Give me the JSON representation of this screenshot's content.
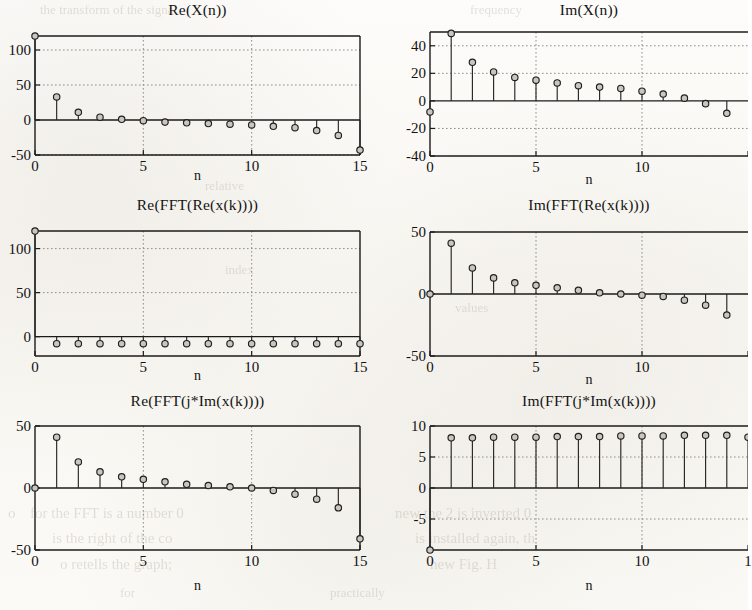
{
  "figure": {
    "background_color": "#fbfaf7",
    "ink_color": "#1b1b1b",
    "marker_fill": "#c9c6bf",
    "grid_color": "#8e8e8e"
  },
  "bleed_through_text": [
    {
      "text": "the transform of the signal",
      "x": 40,
      "y": 2,
      "size": 13
    },
    {
      "text": "frequency",
      "x": 470,
      "y": 2,
      "size": 13
    },
    {
      "text": "relative",
      "x": 205,
      "y": 178,
      "size": 13
    },
    {
      "text": "index",
      "x": 225,
      "y": 262,
      "size": 13
    },
    {
      "text": "values",
      "x": 455,
      "y": 300,
      "size": 13
    },
    {
      "text": "for the FFT is a number 0",
      "x": 30,
      "y": 505,
      "size": 15
    },
    {
      "text": "o",
      "x": 8,
      "y": 505,
      "size": 15
    },
    {
      "text": "is the right of the co",
      "x": 52,
      "y": 530,
      "size": 15
    },
    {
      "text": "o retells the graph;",
      "x": 60,
      "y": 556,
      "size": 15
    },
    {
      "text": "new the  2  is  inverted 0",
      "x": 395,
      "y": 505,
      "size": 15
    },
    {
      "text": "is installed again, th",
      "x": 415,
      "y": 530,
      "size": 15
    },
    {
      "text": "new Fig. H",
      "x": 430,
      "y": 556,
      "size": 15
    },
    {
      "text": "for",
      "x": 120,
      "y": 585,
      "size": 13
    },
    {
      "text": "practically",
      "x": 330,
      "y": 585,
      "size": 13
    }
  ],
  "chart_data": [
    {
      "id": "re-xn",
      "type": "stem",
      "title": "Re(X(n))",
      "xlabel": "n",
      "ylabel": "",
      "x": [
        0,
        1,
        2,
        3,
        4,
        5,
        6,
        7,
        8,
        9,
        10,
        11,
        12,
        13,
        14,
        15
      ],
      "values": [
        120,
        33,
        11,
        4,
        1,
        -1,
        -3,
        -4,
        -5,
        -6,
        -7,
        -9,
        -11,
        -15,
        -22,
        -43
      ],
      "xlim": [
        0,
        15
      ],
      "ylim": [
        -50,
        120
      ],
      "xticks": [
        0,
        5,
        10,
        15
      ],
      "xticklabels": [
        "0",
        "5",
        "10",
        "15"
      ],
      "yticks": [
        -50,
        0,
        50,
        100
      ],
      "yticklabels": [
        "-50",
        "0",
        "50",
        "100"
      ],
      "gridlines_y": [
        -50,
        50,
        100
      ],
      "gridlines_x": [
        5,
        10
      ],
      "grid": true,
      "baseline": 0,
      "clipped_right": false
    },
    {
      "id": "im-xn",
      "type": "stem",
      "title": "Im(X(n))",
      "xlabel": "n",
      "ylabel": "",
      "x": [
        0,
        1,
        2,
        3,
        4,
        5,
        6,
        7,
        8,
        9,
        10,
        11,
        12,
        13,
        14
      ],
      "values": [
        -8,
        49,
        28,
        21,
        17,
        15,
        13,
        11,
        10,
        9,
        7,
        5,
        2,
        -2,
        -9
      ],
      "xlim": [
        0,
        15
      ],
      "ylim": [
        -40,
        50
      ],
      "xticks": [
        0,
        5,
        10,
        15
      ],
      "xticklabels": [
        "0",
        "5",
        "10",
        ""
      ],
      "yticks": [
        -40,
        -20,
        0,
        20,
        40
      ],
      "yticklabels": [
        "-40",
        "-20",
        "0",
        "20",
        "40"
      ],
      "gridlines_y": [
        -20,
        20,
        40
      ],
      "gridlines_x": [
        5,
        10
      ],
      "grid": true,
      "baseline": 0,
      "clipped_right": true
    },
    {
      "id": "re-fft-re-xk",
      "type": "stem",
      "title": "Re(FFT(Re(x(k))))",
      "xlabel": "n",
      "ylabel": "",
      "x": [
        0,
        1,
        2,
        3,
        4,
        5,
        6,
        7,
        8,
        9,
        10,
        11,
        12,
        13,
        14,
        15
      ],
      "values": [
        120,
        -8,
        -8,
        -8,
        -8,
        -8,
        -8,
        -8,
        -8,
        -8,
        -8,
        -8,
        -8,
        -8,
        -8,
        -8
      ],
      "xlim": [
        0,
        15
      ],
      "ylim": [
        -22,
        120
      ],
      "xticks": [
        0,
        5,
        10,
        15
      ],
      "xticklabels": [
        "0",
        "5",
        "10",
        "15"
      ],
      "yticks": [
        0,
        50,
        100
      ],
      "yticklabels": [
        "0",
        "50",
        "100"
      ],
      "gridlines_y": [
        50,
        100
      ],
      "gridlines_x": [
        5,
        10
      ],
      "grid": true,
      "baseline": 0,
      "clipped_right": false
    },
    {
      "id": "im-fft-re-xk",
      "type": "stem",
      "title": "Im(FFT(Re(x(k))))",
      "xlabel": "n",
      "ylabel": "",
      "x": [
        0,
        1,
        2,
        3,
        4,
        5,
        6,
        7,
        8,
        9,
        10,
        11,
        12,
        13,
        14
      ],
      "values": [
        0,
        41,
        21,
        13,
        9,
        7,
        5,
        3,
        1,
        0,
        -1,
        -2,
        -5,
        -9,
        -17
      ],
      "xlim": [
        0,
        15
      ],
      "ylim": [
        -50,
        50
      ],
      "xticks": [
        0,
        5,
        10,
        15
      ],
      "xticklabels": [
        "0",
        "5",
        "10",
        ""
      ],
      "yticks": [
        -50,
        0,
        50
      ],
      "yticklabels": [
        "-50",
        "0",
        "50"
      ],
      "gridlines_y": [],
      "gridlines_x": [
        5,
        10
      ],
      "grid": true,
      "baseline": 0,
      "clipped_right": true
    },
    {
      "id": "re-fft-jim-xk",
      "type": "stem",
      "title": "Re(FFT(j*Im(x(k))))",
      "xlabel": "n",
      "ylabel": "",
      "x": [
        0,
        1,
        2,
        3,
        4,
        5,
        6,
        7,
        8,
        9,
        10,
        11,
        12,
        13,
        14,
        15
      ],
      "values": [
        0,
        41,
        21,
        13,
        9,
        7,
        5,
        3,
        2,
        1,
        0,
        -2,
        -5,
        -9,
        -16,
        -41
      ],
      "xlim": [
        0,
        15
      ],
      "ylim": [
        -50,
        50
      ],
      "xticks": [
        0,
        5,
        10,
        15
      ],
      "xticklabels": [
        "0",
        "5",
        "10",
        "15"
      ],
      "yticks": [
        -50,
        0,
        50
      ],
      "yticklabels": [
        "-50",
        "0",
        "50"
      ],
      "gridlines_y": [],
      "gridlines_x": [
        5,
        10
      ],
      "grid": true,
      "baseline": 0,
      "clipped_right": false
    },
    {
      "id": "im-fft-jim-xk",
      "type": "stem",
      "title": "Im(FFT(j*Im(x(k))))",
      "xlabel": "n",
      "ylabel": "",
      "x": [
        0,
        1,
        2,
        3,
        4,
        5,
        6,
        7,
        8,
        9,
        10,
        11,
        12,
        13,
        14,
        15
      ],
      "values": [
        -10,
        8.1,
        8.1,
        8.2,
        8.2,
        8.2,
        8.3,
        8.3,
        8.3,
        8.4,
        8.4,
        8.4,
        8.5,
        8.5,
        8.5,
        8.2
      ],
      "xlim": [
        0,
        15
      ],
      "ylim": [
        -10,
        10
      ],
      "xticks": [
        0,
        5,
        10,
        15
      ],
      "xticklabels": [
        "0",
        "5",
        "10",
        "1"
      ],
      "yticks": [
        -5,
        0,
        5,
        10
      ],
      "yticklabels": [
        "-5",
        "0",
        "5",
        "10"
      ],
      "gridlines_y": [
        -5,
        5
      ],
      "gridlines_x": [
        5,
        10
      ],
      "grid": true,
      "baseline": 0,
      "clipped_right": true
    }
  ],
  "panel_boxes": [
    {
      "id": "re-xn",
      "left": 35,
      "top": 36,
      "width": 325,
      "height": 119,
      "title_top": 1,
      "xlabel_top": 168
    },
    {
      "id": "im-xn",
      "left": 430,
      "top": 32,
      "width": 318,
      "height": 124,
      "title_top": 1,
      "xlabel_top": 172
    },
    {
      "id": "re-fft-re-xk",
      "left": 35,
      "top": 231,
      "width": 325,
      "height": 125,
      "title_top": 196,
      "xlabel_top": 368
    },
    {
      "id": "im-fft-re-xk",
      "left": 430,
      "top": 232,
      "width": 318,
      "height": 124,
      "title_top": 196,
      "xlabel_top": 372
    },
    {
      "id": "re-fft-jim-xk",
      "left": 35,
      "top": 426,
      "width": 325,
      "height": 124,
      "title_top": 392,
      "xlabel_top": 578
    },
    {
      "id": "im-fft-jim-xk",
      "left": 430,
      "top": 426,
      "width": 318,
      "height": 124,
      "title_top": 392,
      "xlabel_top": 578
    }
  ]
}
